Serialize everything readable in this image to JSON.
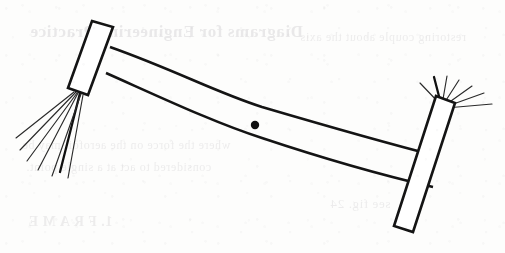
{
  "page": {
    "width": 505,
    "height": 253,
    "background_color": "#fdfdfc",
    "ink_color": "#141414",
    "media": "scanned book page"
  },
  "figure": {
    "name": "two-paddle linkage mechanism",
    "caption": "",
    "label": ""
  },
  "elements": {
    "pivot_dot": {
      "name": "pivot-dot",
      "cx": 255,
      "cy": 125,
      "r": 4.2,
      "color": "#101010"
    },
    "left_paddle": {
      "name": "left-paddle",
      "points": "92,21 113,27 88,95 68,88",
      "tilt": "top-right leaning",
      "stroke_width": 2.6
    },
    "right_paddle": {
      "name": "right-paddle",
      "points": "436,96 455,103 413,232 394,226",
      "tilt": "top-right leaning",
      "stroke_width": 2.6
    },
    "beam": {
      "name": "lens-beam",
      "upper_edge": "110,47 255,104 437,155",
      "lower_edge": "106,73 258,137 433,186",
      "widest_at_centre": true,
      "stroke_width": 2.6
    },
    "left_whiskers": {
      "name": "left-bristle-fan",
      "origin_x": 75,
      "origin_y": 93,
      "count": 7,
      "bold_index": 4
    },
    "right_whiskers": {
      "name": "right-bristle-fan",
      "origin_x": 441,
      "origin_y": 104,
      "count": 7,
      "bold_index": 2
    }
  },
  "bleed_through": {
    "note": "faint mirrored show-through text from the reverse side of the page",
    "color": "#9c9aa0",
    "heading": "Diagrams for Engineering Practice",
    "line_1": "where the force on the aerofoil may be",
    "line_2": "considered to act at a single point.",
    "line_3": "1. F R A M E",
    "line_4": "restoring couple about the axis",
    "line_5": "see fig. 24"
  }
}
